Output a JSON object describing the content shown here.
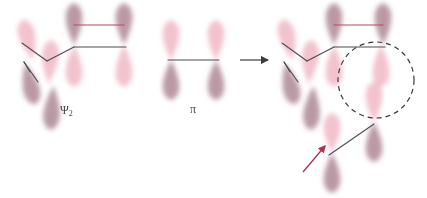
{
  "figure": {
    "type": "orbital-interaction-diagram",
    "background_color": "#ffffff"
  },
  "colors": {
    "lobe_light": "#efb4c2",
    "lobe_dark": "#a9808d",
    "bond_dark": "#4d4d55",
    "bond_red": "#b5485c",
    "arrow_black": "#3a3a3a",
    "arrow_red": "#b03050",
    "circle_dash": "#3a3a3a",
    "label_text": "#4a4a4a"
  },
  "labels": {
    "psi2": "Ψ",
    "psi2_sub": "2",
    "pi": "π"
  },
  "panels": [
    {
      "name": "reactant-diene-psi2",
      "label": "Ψ₂",
      "label_x": 60,
      "label_y": 104,
      "orbitals": [
        {
          "id": "p-left-upper",
          "cx": 28,
          "cy": 40,
          "phase": "light",
          "dir": "up",
          "w": 22,
          "h": 42,
          "rot": -14
        },
        {
          "id": "p-left-lower",
          "cx": 30,
          "cy": 84,
          "phase": "dark",
          "dir": "down",
          "w": 22,
          "h": 42,
          "rot": -14
        },
        {
          "id": "p-mid-upper",
          "cx": 50,
          "cy": 62,
          "phase": "light",
          "dir": "up",
          "w": 22,
          "h": 44,
          "rot": 4
        },
        {
          "id": "p-mid-lower",
          "cx": 52,
          "cy": 108,
          "phase": "dark",
          "dir": "down",
          "w": 22,
          "h": 44,
          "rot": 4
        },
        {
          "id": "p-c3-upper",
          "cx": 74,
          "cy": 24,
          "phase": "dark",
          "dir": "up",
          "w": 22,
          "h": 42,
          "rot": 0
        },
        {
          "id": "p-c3-lower",
          "cx": 74,
          "cy": 66,
          "phase": "light",
          "dir": "down",
          "w": 22,
          "h": 42,
          "rot": 0
        },
        {
          "id": "p-c4-upper",
          "cx": 124,
          "cy": 24,
          "phase": "dark",
          "dir": "up",
          "w": 22,
          "h": 42,
          "rot": 0
        },
        {
          "id": "p-c4-lower",
          "cx": 124,
          "cy": 66,
          "phase": "light",
          "dir": "down",
          "w": 22,
          "h": 42,
          "rot": 0
        }
      ],
      "bonds": [
        {
          "id": "bond-top-red",
          "x1": 74,
          "y1": 25,
          "x2": 124,
          "y2": 25,
          "color": "red"
        },
        {
          "id": "bond-c3c4-dark",
          "x1": 74,
          "y1": 47,
          "x2": 126,
          "y2": 47,
          "color": "dark"
        },
        {
          "id": "bond-c2c3-dark",
          "x1": 47,
          "y1": 61,
          "x2": 74,
          "y2": 47,
          "color": "dark"
        },
        {
          "id": "bond-c1c2-dark",
          "x1": 22,
          "y1": 43,
          "x2": 47,
          "y2": 61,
          "color": "dark"
        },
        {
          "id": "bond-c1-stub",
          "x1": 24,
          "y1": 62,
          "x2": 38,
          "y2": 82,
          "color": "dark"
        },
        {
          "id": "bond-c1-stub2",
          "x1": 24,
          "y1": 62,
          "x2": 30,
          "y2": 72,
          "color": "dark"
        }
      ]
    },
    {
      "name": "reactant-pi",
      "label": "π",
      "label_x": 190,
      "label_y": 103,
      "orbitals": [
        {
          "id": "pi-left-upper",
          "cx": 171,
          "cy": 40,
          "phase": "light",
          "dir": "up",
          "w": 22,
          "h": 40,
          "rot": 0
        },
        {
          "id": "pi-left-lower",
          "cx": 171,
          "cy": 80,
          "phase": "dark",
          "dir": "down",
          "w": 22,
          "h": 40,
          "rot": 0
        },
        {
          "id": "pi-right-upper",
          "cx": 216,
          "cy": 40,
          "phase": "light",
          "dir": "up",
          "w": 22,
          "h": 40,
          "rot": 0
        },
        {
          "id": "pi-right-lower",
          "cx": 216,
          "cy": 80,
          "phase": "dark",
          "dir": "down",
          "w": 22,
          "h": 40,
          "rot": 0
        }
      ],
      "bonds": [
        {
          "id": "bond-pi-sigma",
          "x1": 168,
          "y1": 60,
          "x2": 219,
          "y2": 60,
          "color": "dark"
        }
      ]
    },
    {
      "name": "product-combined",
      "label": "",
      "orbitals": [
        {
          "id": "pr-left-upper",
          "cx": 288,
          "cy": 40,
          "phase": "light",
          "dir": "up",
          "w": 22,
          "h": 42,
          "rot": -14
        },
        {
          "id": "pr-left-lower",
          "cx": 290,
          "cy": 84,
          "phase": "dark",
          "dir": "down",
          "w": 22,
          "h": 42,
          "rot": -14
        },
        {
          "id": "pr-mid-upper",
          "cx": 310,
          "cy": 62,
          "phase": "light",
          "dir": "up",
          "w": 22,
          "h": 44,
          "rot": 4
        },
        {
          "id": "pr-mid-lower",
          "cx": 312,
          "cy": 108,
          "phase": "dark",
          "dir": "down",
          "w": 22,
          "h": 44,
          "rot": 4
        },
        {
          "id": "pr-c3-upper",
          "cx": 334,
          "cy": 24,
          "phase": "dark",
          "dir": "up",
          "w": 22,
          "h": 42,
          "rot": 0
        },
        {
          "id": "pr-c3-lower",
          "cx": 334,
          "cy": 66,
          "phase": "light",
          "dir": "down",
          "w": 22,
          "h": 42,
          "rot": 0
        },
        {
          "id": "pr-c4-upper",
          "cx": 383,
          "cy": 24,
          "phase": "dark",
          "dir": "up",
          "w": 22,
          "h": 42,
          "rot": 0
        },
        {
          "id": "pr-c4-lower",
          "cx": 381,
          "cy": 66,
          "phase": "light",
          "dir": "down",
          "w": 22,
          "h": 42,
          "rot": 0
        },
        {
          "id": "pr-pi-upper",
          "cx": 374,
          "cy": 102,
          "phase": "light",
          "dir": "up",
          "w": 22,
          "h": 40,
          "rot": 0
        },
        {
          "id": "pr-pi-lower",
          "cx": 374,
          "cy": 142,
          "phase": "dark",
          "dir": "down",
          "w": 22,
          "h": 40,
          "rot": 0
        },
        {
          "id": "pr-pi2-upper",
          "cx": 332,
          "cy": 133,
          "phase": "light",
          "dir": "up",
          "w": 22,
          "h": 40,
          "rot": 0
        },
        {
          "id": "pr-pi2-lower",
          "cx": 332,
          "cy": 173,
          "phase": "dark",
          "dir": "down",
          "w": 22,
          "h": 40,
          "rot": 0
        }
      ],
      "bonds": [
        {
          "id": "pr-bond-top-red",
          "x1": 334,
          "y1": 25,
          "x2": 383,
          "y2": 25,
          "color": "red"
        },
        {
          "id": "pr-bond-c3c4-dark",
          "x1": 334,
          "y1": 47,
          "x2": 385,
          "y2": 47,
          "color": "dark"
        },
        {
          "id": "pr-bond-c2c3-dark",
          "x1": 307,
          "y1": 61,
          "x2": 334,
          "y2": 47,
          "color": "dark"
        },
        {
          "id": "pr-bond-c1c2-dark",
          "x1": 282,
          "y1": 43,
          "x2": 307,
          "y2": 61,
          "color": "dark"
        },
        {
          "id": "pr-bond-c1-stub",
          "x1": 284,
          "y1": 62,
          "x2": 298,
          "y2": 82,
          "color": "dark"
        },
        {
          "id": "pr-bond-c1-stub2",
          "x1": 284,
          "y1": 62,
          "x2": 290,
          "y2": 72,
          "color": "dark"
        },
        {
          "id": "pr-bond-new-sigma",
          "x1": 329,
          "y1": 155,
          "x2": 374,
          "y2": 124,
          "color": "dark"
        }
      ],
      "annotations": {
        "dashed_circle": {
          "cx": 376,
          "cy": 80,
          "r": 38
        },
        "red_arrow": {
          "x1": 303,
          "y1": 172,
          "x2": 325,
          "y2": 146
        }
      }
    }
  ],
  "reaction_arrow": {
    "name": "reaction-arrow",
    "x1": 240,
    "y1": 60,
    "x2": 268,
    "y2": 60
  }
}
